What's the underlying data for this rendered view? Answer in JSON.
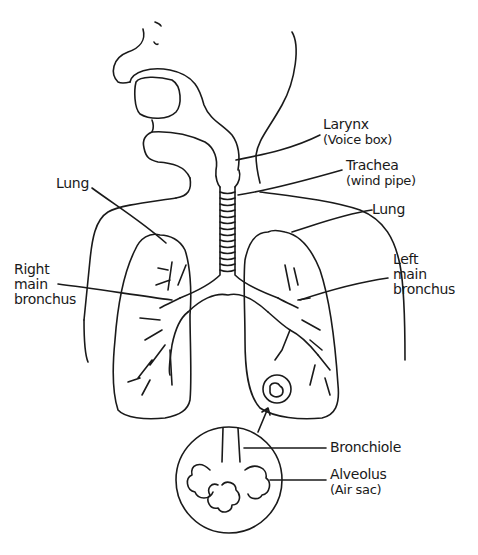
{
  "diagram": {
    "type": "anatomical-line-drawing",
    "colors": {
      "stroke": "#1a1a1a",
      "background": "#ffffff"
    },
    "labels": {
      "larynx": {
        "name": "Larynx",
        "note": "(Voice box)"
      },
      "trachea": {
        "name": "Trachea",
        "note": "(wind pipe)"
      },
      "lung_left_side_label": {
        "name": "Lung"
      },
      "lung_right_side_label": {
        "name": "Lung"
      },
      "right_main_bronchus": {
        "line1": "Right",
        "line2": "main",
        "line3": "bronchus"
      },
      "left_main_bronchus": {
        "line1": "Left",
        "line2": "main",
        "line3": "bronchus"
      },
      "bronchiole": {
        "name": "Bronchiole"
      },
      "alveolus": {
        "name": "Alveolus",
        "note": "(Air sac)"
      }
    }
  }
}
